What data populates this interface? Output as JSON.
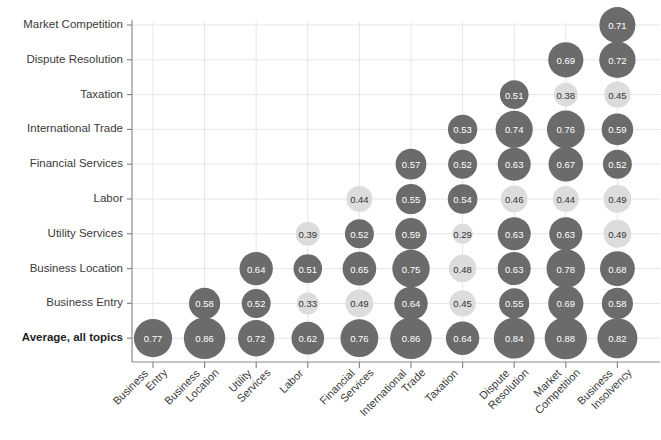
{
  "chart_data": {
    "type": "heatmap",
    "title": "",
    "xlabel": "",
    "ylabel": "",
    "grid": true,
    "legend": "none",
    "value_format": "0.00",
    "note": "Lower-triangular bubble matrix; bubble area scales with value, fill darkens above threshold 0.50",
    "color_high": "#6b6b6b",
    "color_low": "#dcdcdc",
    "color_threshold": 0.5,
    "label_color_high": "#ffffff",
    "label_color_low": "#333333",
    "categories": [
      "Business Entry",
      "Business Location",
      "Utility Services",
      "Labor",
      "Financial Services",
      "International Trade",
      "Taxation",
      "Dispute Resolution",
      "Market Competition",
      "Business Insolvency"
    ],
    "rows": [
      "Market Competition",
      "Dispute Resolution",
      "Taxation",
      "International Trade",
      "Financial Services",
      "Labor",
      "Utility Services",
      "Business Location",
      "Business Entry",
      "Average, all topics"
    ],
    "row_emphasis": [
      false,
      false,
      false,
      false,
      false,
      false,
      false,
      false,
      false,
      true
    ],
    "values": [
      [
        null,
        null,
        null,
        null,
        null,
        null,
        null,
        null,
        null,
        0.71
      ],
      [
        null,
        null,
        null,
        null,
        null,
        null,
        null,
        null,
        0.69,
        0.72
      ],
      [
        null,
        null,
        null,
        null,
        null,
        null,
        null,
        0.51,
        0.38,
        0.45
      ],
      [
        null,
        null,
        null,
        null,
        null,
        null,
        0.53,
        0.74,
        0.76,
        0.59
      ],
      [
        null,
        null,
        null,
        null,
        null,
        0.57,
        0.52,
        0.63,
        0.67,
        0.52
      ],
      [
        null,
        null,
        null,
        null,
        0.44,
        0.55,
        0.54,
        0.46,
        0.44,
        0.49
      ],
      [
        null,
        null,
        null,
        0.39,
        0.52,
        0.59,
        0.29,
        0.63,
        0.63,
        0.49
      ],
      [
        null,
        null,
        0.64,
        0.51,
        0.65,
        0.75,
        0.48,
        0.63,
        0.78,
        0.68
      ],
      [
        null,
        0.58,
        0.52,
        0.33,
        0.49,
        0.64,
        0.45,
        0.55,
        0.69,
        0.58
      ],
      [
        0.77,
        0.86,
        0.72,
        0.62,
        0.76,
        0.86,
        0.64,
        0.84,
        0.88,
        0.82
      ]
    ]
  }
}
